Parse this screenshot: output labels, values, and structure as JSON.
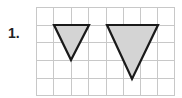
{
  "problem": {
    "number": "1."
  },
  "grid": {
    "columns": 8,
    "rows": 5,
    "line_color": "#c8c8c8"
  },
  "shapes": [
    {
      "type": "triangle",
      "orientation": "inverted",
      "size": "small",
      "fill": "#d4d4d4",
      "stroke": "#1a1a1a"
    },
    {
      "type": "triangle",
      "orientation": "inverted",
      "size": "large",
      "fill": "#d4d4d4",
      "stroke": "#1a1a1a"
    }
  ]
}
